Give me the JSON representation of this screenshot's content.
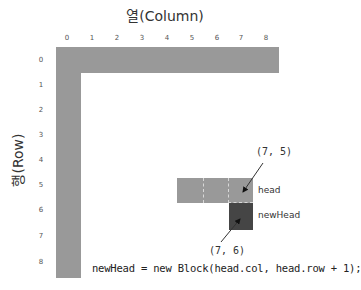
{
  "title": "열(Column)",
  "y_axis_label": "행(Row)",
  "columns": [
    "0",
    "1",
    "2",
    "3",
    "4",
    "5",
    "6",
    "7",
    "8"
  ],
  "rows": [
    "0",
    "1",
    "2",
    "3",
    "4",
    "5",
    "6",
    "7",
    "8"
  ],
  "annotations": {
    "head_coord": "(7, 5)",
    "newhead_coord": "(7, 6)",
    "head_label": "head",
    "newhead_label": "newHead"
  },
  "code": "newHead = new Block(head.col, head.row + 1);",
  "colors": {
    "body": "#999999",
    "new_head": "#454545",
    "grid_dash": "#d8d8d8"
  },
  "snake": {
    "body_cells": "row 0 cols 0-8; col 0 rows 0-8; row 5 cols 5-7",
    "head": {
      "col": 7,
      "row": 5
    },
    "new_head": {
      "col": 7,
      "row": 6
    }
  }
}
